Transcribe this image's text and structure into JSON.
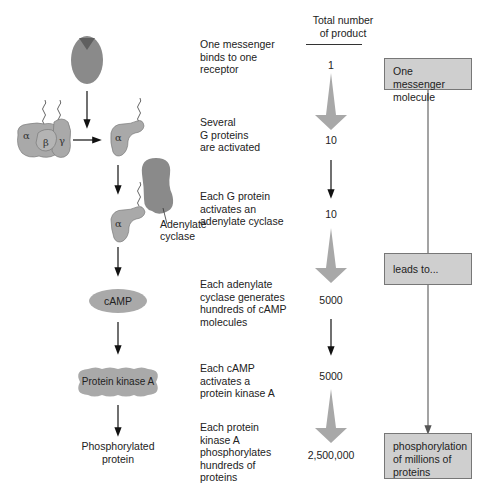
{
  "header": {
    "column_title_line1": "Total number",
    "column_title_line2": "of product"
  },
  "steps": [
    {
      "description": [
        "One messenger",
        "binds to one",
        "receptor"
      ],
      "count": "1"
    },
    {
      "description": [
        "Several",
        "G proteins",
        "are activated"
      ],
      "count": "10"
    },
    {
      "description": [
        "Each G protein",
        "activates an",
        "adenylate cyclase"
      ],
      "count": "10"
    },
    {
      "description": [
        "Each adenylate",
        "cyclase generates",
        "hundreds of cAMP",
        "molecules"
      ],
      "count": "5000"
    },
    {
      "description": [
        "Each cAMP",
        "activates a",
        "protein kinase A"
      ],
      "count": "5000"
    },
    {
      "description": [
        "Each protein",
        "kinase A",
        "phosphorylates",
        "hundreds of",
        "proteins"
      ],
      "count": "2,500,000"
    }
  ],
  "molecules": {
    "alpha": "α",
    "beta": "β",
    "gamma": "γ",
    "adenylate_cyclase_line1": "Adenylate",
    "adenylate_cyclase_line2": "cyclase",
    "camp": "cAMP",
    "pka": "Protein kinase A",
    "phospho_line1": "Phosphorylated",
    "phospho_line2": "protein"
  },
  "summary_boxes": [
    {
      "line1": "One messenger",
      "line2": "molecule"
    },
    {
      "line1": "leads to..."
    },
    {
      "line1": "phosphorylation",
      "line2": "of millions of",
      "line3": "proteins"
    }
  ],
  "colors": {
    "protein_fill": "#a9a9a9",
    "receptor_fill": "#8a8a8a",
    "amplify_arrow": "#a8a8a8",
    "box_fill": "#cfcfcf"
  }
}
